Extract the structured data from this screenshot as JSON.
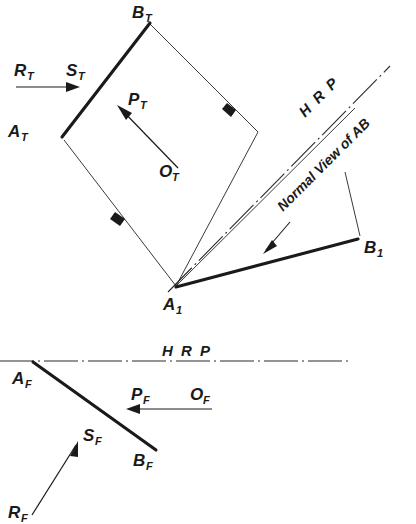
{
  "figure": {
    "ink_color": "#1a1a1a",
    "paper_color": "#ffffff"
  },
  "top_view": {
    "vertex_labels": {
      "a_t": {
        "main": "A",
        "sub": "T"
      },
      "b_t": {
        "main": "B",
        "sub": "T"
      },
      "o_t": {
        "main": "O",
        "sub": "T"
      },
      "p_t": {
        "main": "P",
        "sub": "T"
      },
      "r_t": {
        "main": "R",
        "sub": "T"
      },
      "s_t": {
        "main": "S",
        "sub": "T"
      },
      "a_1": {
        "main": "A",
        "sub": "1"
      },
      "b_1": {
        "main": "B",
        "sub": "1"
      }
    },
    "hrp_label": "H R P",
    "note_label": "Normal View of AB"
  },
  "front_view": {
    "hrp_label": "H R P",
    "vertex_labels": {
      "a_f": {
        "main": "A",
        "sub": "F"
      },
      "b_f": {
        "main": "B",
        "sub": "F"
      },
      "o_f": {
        "main": "O",
        "sub": "F"
      },
      "p_f": {
        "main": "P",
        "sub": "F"
      },
      "r_f": {
        "main": "R",
        "sub": "F"
      },
      "s_f": {
        "main": "S",
        "sub": "F"
      }
    }
  },
  "icons": {
    "arrowhead": "arrowhead-icon",
    "chain_line": "chain-dash-dot-line-icon"
  }
}
